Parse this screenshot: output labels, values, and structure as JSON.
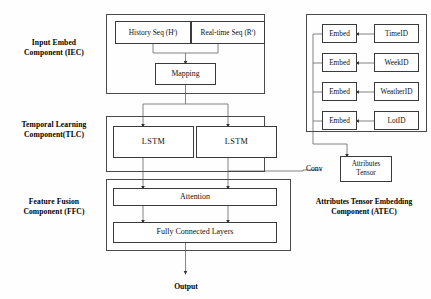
{
  "figure": {
    "output_label": "Output"
  },
  "side_labels": [
    {
      "id": "iec",
      "line1": "Input Embed",
      "line2": "Component (IEC)"
    },
    {
      "id": "tlc",
      "line1": "Temporal Learning",
      "line2": "Component(TLC)"
    },
    {
      "id": "ffc",
      "line1": "Feature Fusion",
      "line2": "Component (FFC)"
    }
  ],
  "iec": {
    "nodes": [
      {
        "id": "history-seq",
        "label": "History Seq (H",
        "sup": "t",
        "tail": ")"
      },
      {
        "id": "realtime-seq",
        "label": "Real-time Seq (R",
        "sup": "t",
        "tail": ")"
      }
    ],
    "mapping": "Mapping"
  },
  "tlc": {
    "nodes": [
      {
        "id": "lstm-left",
        "label": "LSTM"
      },
      {
        "id": "lstm-right",
        "label": "LSTM"
      }
    ]
  },
  "ffc": {
    "attention": "Attention",
    "fully_connected": "Fully Connected Layers"
  },
  "atec": {
    "caption_line1": "Attributes Tensor Embedding",
    "caption_line2": "Component (ATEC)",
    "conv_label": "Conv",
    "attributes_tensor_line1": "Attributes",
    "attributes_tensor_line2": "Tensor",
    "rows": [
      {
        "embed": "Embed",
        "id": "TimeID"
      },
      {
        "embed": "Embed",
        "id": "WeekID"
      },
      {
        "embed": "Embed",
        "id": "WeatherID"
      },
      {
        "embed": "Embed",
        "id": "LotID"
      }
    ]
  },
  "colors": {
    "box_border": "#3a3a3a",
    "group_border": "#4a4a4a",
    "connector": "#555555",
    "background": "#fefefe",
    "text": "#111111"
  }
}
